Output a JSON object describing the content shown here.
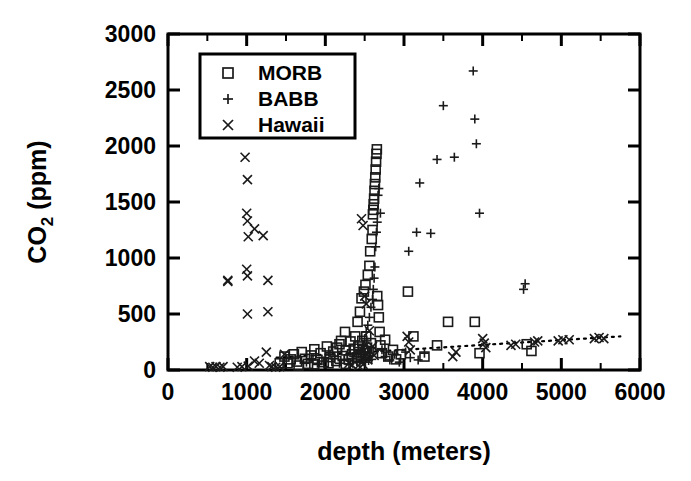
{
  "chart_data": {
    "type": "scatter",
    "title": "",
    "xlabel": "depth (meters)",
    "ylabel_main": "CO",
    "ylabel_sub": "2",
    "ylabel_unit": " (ppm)",
    "ylabel_full": "CO2 (ppm)",
    "xlim": [
      0,
      6000
    ],
    "ylim": [
      0,
      3000
    ],
    "xticks": [
      0,
      1000,
      2000,
      3000,
      4000,
      5000,
      6000
    ],
    "xtick_labels": [
      "0",
      "1000",
      "2000",
      "3000",
      "4000",
      "5000",
      "6000"
    ],
    "xminor_step": 500,
    "yticks": [
      0,
      500,
      1000,
      1500,
      2000,
      2500,
      3000
    ],
    "ytick_labels": [
      "0",
      "500",
      "1000",
      "1500",
      "2000",
      "2500",
      "3000"
    ],
    "grid": false,
    "legend_position": "upper-left-inside",
    "legend_entries": [
      {
        "label": "MORB",
        "marker": "square"
      },
      {
        "label": "BABB",
        "marker": "plus"
      },
      {
        "label": "Hawaii",
        "marker": "cross"
      }
    ],
    "trendline": {
      "style": "dotted",
      "x_start": 1380,
      "y_start": 110,
      "x_end": 5750,
      "y_end": 300
    },
    "series": [
      {
        "name": "MORB",
        "marker": "square",
        "points": [
          [
            1480,
            120
          ],
          [
            1520,
            60
          ],
          [
            1560,
            95
          ],
          [
            1600,
            140
          ],
          [
            1640,
            75
          ],
          [
            1700,
            160
          ],
          [
            1740,
            100
          ],
          [
            1780,
            55
          ],
          [
            1820,
            130
          ],
          [
            1860,
            185
          ],
          [
            1900,
            90
          ],
          [
            1940,
            150
          ],
          [
            1980,
            70
          ],
          [
            2020,
            210
          ],
          [
            2060,
            115
          ],
          [
            2100,
            165
          ],
          [
            2140,
            80
          ],
          [
            2180,
            230
          ],
          [
            2220,
            125
          ],
          [
            2260,
            175
          ],
          [
            2300,
            95
          ],
          [
            2320,
            255
          ],
          [
            2340,
            140
          ],
          [
            2360,
            190
          ],
          [
            2380,
            300
          ],
          [
            2400,
            110
          ],
          [
            2410,
            430
          ],
          [
            2420,
            210
          ],
          [
            2430,
            160
          ],
          [
            2440,
            520
          ],
          [
            2450,
            130
          ],
          [
            2460,
            640
          ],
          [
            2470,
            260
          ],
          [
            2480,
            180
          ],
          [
            2490,
            700
          ],
          [
            2500,
            150
          ],
          [
            2510,
            760
          ],
          [
            2520,
            300
          ],
          [
            2530,
            200
          ],
          [
            2540,
            850
          ],
          [
            2550,
            170
          ],
          [
            2560,
            930
          ],
          [
            2570,
            1060
          ],
          [
            2580,
            240
          ],
          [
            2590,
            1170
          ],
          [
            2600,
            1250
          ],
          [
            2605,
            1390
          ],
          [
            2610,
            1430
          ],
          [
            2615,
            1480
          ],
          [
            2620,
            1530
          ],
          [
            2625,
            1600
          ],
          [
            2630,
            1660
          ],
          [
            2635,
            1720
          ],
          [
            2640,
            1790
          ],
          [
            2645,
            1860
          ],
          [
            2650,
            1930
          ],
          [
            2655,
            1970
          ],
          [
            2660,
            660
          ],
          [
            2670,
            580
          ],
          [
            2680,
            470
          ],
          [
            2690,
            340
          ],
          [
            2700,
            220
          ],
          [
            2720,
            150
          ],
          [
            2760,
            270
          ],
          [
            2800,
            120
          ],
          [
            2860,
            180
          ],
          [
            2900,
            95
          ],
          [
            2960,
            140
          ],
          [
            3050,
            700
          ],
          [
            3120,
            300
          ],
          [
            3260,
            120
          ],
          [
            3420,
            220
          ],
          [
            3560,
            430
          ],
          [
            3900,
            430
          ],
          [
            3960,
            150
          ],
          [
            4560,
            230
          ],
          [
            4620,
            170
          ],
          [
            2250,
            340
          ],
          [
            2200,
            260
          ],
          [
            2150,
            200
          ],
          [
            1420,
            60
          ],
          [
            1660,
            40
          ],
          [
            1860,
            50
          ],
          [
            2040,
            60
          ],
          [
            2260,
            55
          ]
        ]
      },
      {
        "name": "BABB",
        "marker": "plus",
        "points": [
          [
            2180,
            60
          ],
          [
            2240,
            90
          ],
          [
            2300,
            50
          ],
          [
            2360,
            120
          ],
          [
            2400,
            75
          ],
          [
            2420,
            140
          ],
          [
            2440,
            65
          ],
          [
            2460,
            180
          ],
          [
            2470,
            90
          ],
          [
            2480,
            230
          ],
          [
            2490,
            110
          ],
          [
            2500,
            280
          ],
          [
            2510,
            70
          ],
          [
            2520,
            340
          ],
          [
            2530,
            130
          ],
          [
            2540,
            400
          ],
          [
            2550,
            85
          ],
          [
            2560,
            470
          ],
          [
            2570,
            150
          ],
          [
            2580,
            560
          ],
          [
            2590,
            95
          ],
          [
            2600,
            630
          ],
          [
            2610,
            720
          ],
          [
            2620,
            820
          ],
          [
            2630,
            920
          ],
          [
            2640,
            1100
          ],
          [
            2650,
            1230
          ],
          [
            2660,
            1320
          ],
          [
            2670,
            1560
          ],
          [
            2680,
            1620
          ],
          [
            2700,
            1400
          ],
          [
            2720,
            180
          ],
          [
            2760,
            120
          ],
          [
            2820,
            90
          ],
          [
            2880,
            140
          ],
          [
            2940,
            70
          ],
          [
            3060,
            1060
          ],
          [
            3160,
            1230
          ],
          [
            3200,
            1670
          ],
          [
            3340,
            1220
          ],
          [
            3420,
            1880
          ],
          [
            3500,
            2360
          ],
          [
            3640,
            1900
          ],
          [
            3880,
            2670
          ],
          [
            3900,
            2240
          ],
          [
            3920,
            2020
          ],
          [
            3960,
            1400
          ],
          [
            4520,
            720
          ],
          [
            4540,
            770
          ],
          [
            2060,
            140
          ],
          [
            2120,
            100
          ],
          [
            1980,
            80
          ],
          [
            1900,
            60
          ],
          [
            1820,
            100
          ],
          [
            1760,
            70
          ],
          [
            3020,
            160
          ],
          [
            3080,
            110
          ],
          [
            3180,
            90
          ],
          [
            3260,
            150
          ]
        ]
      },
      {
        "name": "Hawaii",
        "marker": "cross",
        "points": [
          [
            530,
            30
          ],
          [
            570,
            25
          ],
          [
            610,
            30
          ],
          [
            660,
            25
          ],
          [
            700,
            30
          ],
          [
            760,
            790
          ],
          [
            980,
            1900
          ],
          [
            1010,
            1700
          ],
          [
            1000,
            1400
          ],
          [
            1010,
            1330
          ],
          [
            1100,
            1260
          ],
          [
            1020,
            1190
          ],
          [
            1000,
            900
          ],
          [
            1010,
            840
          ],
          [
            760,
            800
          ],
          [
            1270,
            800
          ],
          [
            1210,
            1200
          ],
          [
            1010,
            500
          ],
          [
            1270,
            520
          ],
          [
            1290,
            40
          ],
          [
            1320,
            30
          ],
          [
            1370,
            25
          ],
          [
            1420,
            30
          ],
          [
            1250,
            160
          ],
          [
            1480,
            140
          ],
          [
            1100,
            80
          ],
          [
            1160,
            60
          ],
          [
            1020,
            35
          ],
          [
            940,
            30
          ],
          [
            880,
            25
          ],
          [
            2460,
            1350
          ],
          [
            2480,
            1290
          ],
          [
            2500,
            660
          ],
          [
            2520,
            590
          ],
          [
            2560,
            350
          ],
          [
            2600,
            210
          ],
          [
            2620,
            130
          ],
          [
            2540,
            90
          ],
          [
            2480,
            50
          ],
          [
            2420,
            40
          ],
          [
            3040,
            300
          ],
          [
            3060,
            250
          ],
          [
            3080,
            180
          ],
          [
            3620,
            120
          ],
          [
            3660,
            160
          ],
          [
            4000,
            280
          ],
          [
            4020,
            240
          ],
          [
            4040,
            200
          ],
          [
            4360,
            220
          ],
          [
            4420,
            230
          ],
          [
            4660,
            250
          ],
          [
            4700,
            260
          ],
          [
            4960,
            260
          ],
          [
            5020,
            270
          ],
          [
            5100,
            270
          ],
          [
            5420,
            280
          ],
          [
            5480,
            290
          ],
          [
            5540,
            280
          ],
          [
            2300,
            60
          ],
          [
            2340,
            45
          ]
        ]
      }
    ]
  },
  "axes": {
    "x_label": "depth (meters)",
    "y_label_prefix": "CO",
    "y_label_subscript": "2",
    "y_label_suffix": " (ppm)"
  },
  "colors": {
    "marker": "#1a1a1a",
    "axis": "#000000",
    "background": "#ffffff"
  }
}
